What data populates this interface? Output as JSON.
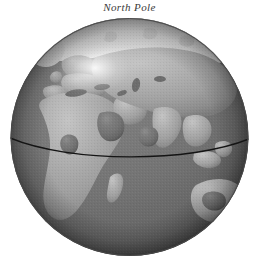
{
  "caption": {
    "text": "North Pole"
  },
  "figure": {
    "kind": "globe-illustration",
    "visible_regions": [
      "Europe",
      "Africa",
      "Asia",
      "Arabian Peninsula",
      "Indian subcontinent",
      "Southeast Asia",
      "Australia",
      "Greenland",
      "Arctic polar region",
      "Madagascar"
    ],
    "overlay_line": "equator-line"
  },
  "colors": {
    "background": "#ffffff",
    "ocean": "#747474",
    "ocean_dark": "#4e4e4e",
    "ocean_light": "#8a8a8a",
    "land": "#a6a6a6",
    "land_light": "#c0c0c0",
    "land_dark": "#858585",
    "polar_ice": "#d8d8d8",
    "highlight": "#f2f2f2",
    "limb_shadow": "#3c3c3c",
    "equator_line": "#1a1a1a",
    "caption_text": "#3a3a3a"
  },
  "geometry": {
    "globe_center_x": 129,
    "globe_center_y": 137,
    "globe_radius": 119,
    "highlight_x": 95,
    "highlight_y": 68,
    "equator_left_y": 138,
    "equator_center_y": 156,
    "equator_right_y": 139
  }
}
